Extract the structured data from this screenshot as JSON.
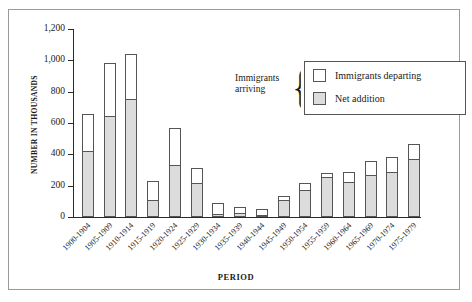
{
  "chart_data": {
    "type": "bar",
    "subtype": "stacked-bar",
    "title": "",
    "xlabel": "PERIOD",
    "ylabel": "NUMBER IN THOUSANDS",
    "ylim": [
      0,
      1200
    ],
    "y_ticks": [
      0,
      200,
      400,
      600,
      800,
      1000,
      1200
    ],
    "y_tick_labels": [
      "0",
      "200",
      "400",
      "600",
      "800",
      "1,000",
      "1,200"
    ],
    "grid": false,
    "legend_position": "upper-right-inside",
    "categories": [
      "1900-1904",
      "1905-1909",
      "1910-1914",
      "1915-1919",
      "1920-1924",
      "1925-1929",
      "1930-1934",
      "1935-1939",
      "1940-1944",
      "1945-1949",
      "1950-1954",
      "1955-1959",
      "1960-1964",
      "1965-1969",
      "1970-1974",
      "1975-1979"
    ],
    "series": [
      {
        "name": "Net addition",
        "color": "#dcdcdc",
        "values": [
          412,
          640,
          750,
          105,
          328,
          212,
          12,
          18,
          5,
          105,
          165,
          248,
          218,
          263,
          278,
          362
        ]
      },
      {
        "name": "Immigrants departing",
        "color": "#ffffff",
        "values": [
          243,
          345,
          290,
          125,
          242,
          102,
          78,
          45,
          48,
          28,
          52,
          30,
          68,
          95,
          102,
          103
        ]
      }
    ],
    "totals_label": "Immigrants arriving",
    "totals": [
      655,
      985,
      1040,
      230,
      570,
      314,
      90,
      63,
      53,
      133,
      217,
      278,
      286,
      358,
      380,
      465
    ],
    "annotations": [
      "Immigrants arriving"
    ]
  },
  "legend": {
    "arriving_label_line1": "Immigrants",
    "arriving_label_line2": "arriving",
    "brace_glyph": "{",
    "items": [
      {
        "label": "Immigrants departing",
        "swatch": "white"
      },
      {
        "label": "Net addition",
        "swatch": "gray"
      }
    ]
  },
  "axes": {
    "y_title": "NUMBER IN THOUSANDS",
    "x_title": "PERIOD"
  }
}
